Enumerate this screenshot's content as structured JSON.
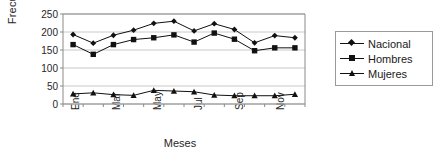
{
  "chart_data": {
    "type": "line",
    "title": "",
    "xlabel": "Meses",
    "ylabel": "Frecuencia",
    "ylim": [
      0,
      250
    ],
    "yticks": [
      0,
      50,
      100,
      150,
      200,
      250
    ],
    "grid": true,
    "legend_position": "right",
    "categories": [
      "Ene",
      "Feb",
      "Mar",
      "Abr",
      "May",
      "Jun",
      "Jul",
      "Ago",
      "Sep",
      "Oct",
      "Nov",
      "Dic"
    ],
    "tick_labels_shown": [
      "Ene",
      "Mar",
      "May",
      "Jul",
      "Sep",
      "Nov"
    ],
    "series": [
      {
        "name": "Nacional",
        "marker": "diamond",
        "values": [
          193,
          169,
          191,
          205,
          224,
          230,
          203,
          223,
          207,
          170,
          190,
          184
        ]
      },
      {
        "name": "Hombres",
        "marker": "square",
        "values": [
          165,
          138,
          165,
          179,
          184,
          192,
          172,
          197,
          180,
          148,
          156,
          156
        ]
      },
      {
        "name": "Mujeres",
        "marker": "triangle",
        "values": [
          28,
          31,
          26,
          24,
          38,
          36,
          34,
          25,
          23,
          23,
          23,
          27
        ]
      }
    ]
  },
  "axes": {
    "ylabel": "Frecuencia",
    "xlabel": "Meses",
    "ytick_labels": [
      "250",
      "200",
      "150",
      "100",
      "50",
      "0"
    ],
    "xtick_labels": [
      "Ene",
      "Mar",
      "May",
      "Jul",
      "Sep",
      "Nov"
    ]
  },
  "legend": {
    "items": [
      {
        "label": "Nacional",
        "marker": "diamond-marker"
      },
      {
        "label": "Hombres",
        "marker": "square-marker"
      },
      {
        "label": "Mujeres",
        "marker": "triangle-marker"
      }
    ]
  },
  "colors": {
    "series_line": "#111111",
    "grid": "#c9c9c9",
    "axis": "#8a8a8a",
    "background": "#ffffff"
  }
}
